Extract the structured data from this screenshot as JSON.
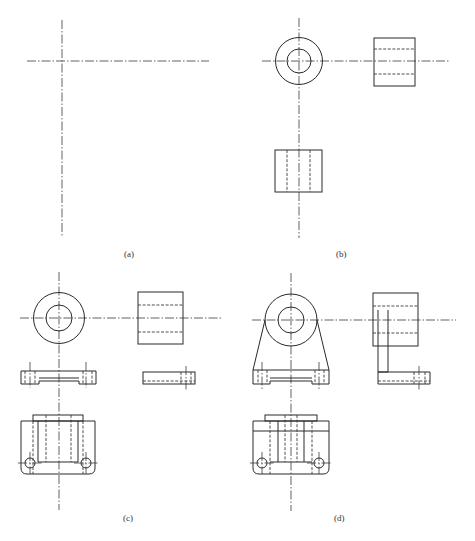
{
  "figure": {
    "panels": [
      {
        "id": "a",
        "label": "(a)"
      },
      {
        "id": "b",
        "label": "(b)"
      },
      {
        "id": "c",
        "label": "(c)"
      },
      {
        "id": "d",
        "label": "(d)"
      }
    ]
  },
  "colors": {
    "line": "#2a2a2a",
    "background": "#ffffff"
  }
}
